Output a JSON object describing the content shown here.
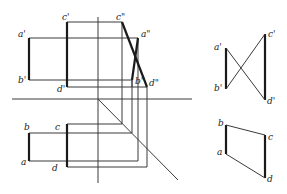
{
  "diagram": {
    "labels": {
      "front": {
        "a": "a'",
        "b": "b'",
        "c": "c'",
        "d": "d'"
      },
      "side": {
        "a": "a\"",
        "b": "b\"",
        "c": "c\"",
        "d": "d\""
      },
      "top": {
        "a": "a",
        "b": "b",
        "c": "c",
        "d": "d"
      },
      "answer_side": {
        "a": "a'",
        "b": "b'",
        "c": "c'",
        "d": "d'"
      },
      "answer_top": {
        "a": "a",
        "b": "b",
        "c": "c",
        "d": "d"
      }
    },
    "colors": {
      "line": "#3a3a3a",
      "bold": "#1a1a1a",
      "background": "#ffffff"
    }
  }
}
